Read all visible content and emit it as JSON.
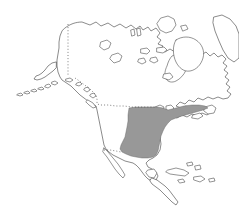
{
  "figure": {
    "kind": "species-distribution-map",
    "region": "North America",
    "title": "",
    "caption": "",
    "background_color": "#ffffff",
    "width": 239,
    "height": 216
  },
  "styles": {
    "land_fill": "#ffffff",
    "coastline_color": "#3c3c3c",
    "range_fill": "#989898",
    "range_outline": "#5e5e5e",
    "border_color": "#4a4a4a",
    "coastline_width": 0.6,
    "border_dash": "dotted"
  },
  "legend": {
    "visible": false,
    "entries": [
      {
        "label": "Distribution range",
        "swatch_color": "#989898"
      }
    ]
  },
  "range": {
    "name": "shaded-distribution-range",
    "fill": "#989898",
    "description": "Eastern and southeastern United States extending from the Great Plains east to the Atlantic coast and northeast along the coastal strip toward the Maritimes",
    "northern_limit": "US-Canada border (49th parallel)",
    "southern_limit": "Gulf Coast, excluding the Florida peninsula",
    "western_limit": "Great Plains"
  },
  "landmasses": [
    {
      "name": "mainland-north-america",
      "label": "North American mainland"
    },
    {
      "name": "alaska",
      "label": "Alaska"
    },
    {
      "name": "aleutian-islands",
      "label": "Aleutian Islands"
    },
    {
      "name": "greenland-edge",
      "label": "Greenland margin"
    },
    {
      "name": "canadian-arctic-archipelago",
      "label": "Canadian Arctic Archipelago"
    },
    {
      "name": "baffin-island",
      "label": "Baffin Island"
    },
    {
      "name": "victoria-island",
      "label": "Victoria Island"
    },
    {
      "name": "banks-island",
      "label": "Banks Island"
    },
    {
      "name": "newfoundland",
      "label": "Newfoundland"
    },
    {
      "name": "vancouver-island",
      "label": "Vancouver Island"
    },
    {
      "name": "baja-california",
      "label": "Baja California"
    },
    {
      "name": "cuba",
      "label": "Cuba"
    },
    {
      "name": "hispaniola",
      "label": "Hispaniola"
    },
    {
      "name": "jamaica",
      "label": "Jamaica"
    },
    {
      "name": "bahamas",
      "label": "Bahamas"
    },
    {
      "name": "puerto-rico",
      "label": "Puerto Rico"
    },
    {
      "name": "central-america",
      "label": "Central America"
    }
  ],
  "water_bodies": [
    {
      "name": "hudson-bay",
      "label": "Hudson Bay"
    },
    {
      "name": "great-lakes",
      "label": "Great Lakes"
    },
    {
      "name": "gulf-of-california",
      "label": "Gulf of California"
    }
  ],
  "borders": [
    {
      "name": "alaska-yukon-border",
      "label": "Alaska / Yukon border (141°W)",
      "style": "dotted"
    },
    {
      "name": "usa-canada-border",
      "label": "United States / Canada border (49th parallel)",
      "style": "dotted"
    },
    {
      "name": "usa-mexico-border",
      "label": "United States / Mexico border",
      "style": "dotted"
    }
  ]
}
